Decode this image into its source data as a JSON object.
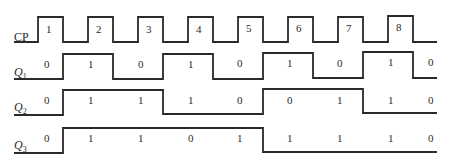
{
  "diagram": {
    "signals": [
      {
        "id": "cp",
        "label_main": "CP",
        "label_sub": "",
        "label_x": 14,
        "label_y": 41,
        "path": "M14,42 L38,42 L38,17 L63,17 L63,42 L88,42 L88,17 L113,17 L113,42 L138,42 L138,17 L163,17 L163,42 L188,42 L188,17 L213,17 L213,42 L238,42 L238,17 L263,17 L263,42 L288,42 L288,17 L313,17 L313,42 L338,42 L338,17 L363,17 L363,42 L388,42 L388,16 L413,16 L413,42 L437,42",
        "values": [
          {
            "text": "1",
            "x": 46,
            "y": 33
          },
          {
            "text": "2",
            "x": 96,
            "y": 33
          },
          {
            "text": "3",
            "x": 146,
            "y": 33
          },
          {
            "text": "4",
            "x": 196,
            "y": 33
          },
          {
            "text": "5",
            "x": 246,
            "y": 32
          },
          {
            "text": "6",
            "x": 296,
            "y": 32
          },
          {
            "text": "7",
            "x": 346,
            "y": 32
          },
          {
            "text": "8",
            "x": 396,
            "y": 31
          }
        ]
      },
      {
        "id": "q1",
        "label_main": "Q",
        "label_sub": "1",
        "label_x": 14,
        "label_y": 76,
        "path": "M14,79 L63,79 L63,54 L113,54 L113,79 L163,79 L163,54 L213,54 L213,79 L263,79 L263,53 L313,53 L313,78 L363,78 L363,52 L413,52 L413,78 L437,78",
        "values": [
          {
            "text": "0",
            "x": 44,
            "y": 68
          },
          {
            "text": "1",
            "x": 88,
            "y": 68
          },
          {
            "text": "0",
            "x": 138,
            "y": 68
          },
          {
            "text": "1",
            "x": 188,
            "y": 68
          },
          {
            "text": "0",
            "x": 237,
            "y": 67
          },
          {
            "text": "1",
            "x": 287,
            "y": 67
          },
          {
            "text": "0",
            "x": 337,
            "y": 67
          },
          {
            "text": "1",
            "x": 388,
            "y": 66
          },
          {
            "text": "0",
            "x": 428,
            "y": 66
          }
        ]
      },
      {
        "id": "q2",
        "label_main": "Q",
        "label_sub": "2",
        "label_x": 14,
        "label_y": 111,
        "path": "M14,115 L63,115 L63,90 L163,90 L163,114 L263,114 L263,89 L363,89 L363,113 L437,113",
        "values": [
          {
            "text": "0",
            "x": 44,
            "y": 104
          },
          {
            "text": "1",
            "x": 88,
            "y": 104
          },
          {
            "text": "1",
            "x": 138,
            "y": 104
          },
          {
            "text": "1",
            "x": 188,
            "y": 104
          },
          {
            "text": "0",
            "x": 237,
            "y": 104
          },
          {
            "text": "0",
            "x": 287,
            "y": 104
          },
          {
            "text": "1",
            "x": 337,
            "y": 104
          },
          {
            "text": "1",
            "x": 388,
            "y": 104
          },
          {
            "text": "0",
            "x": 428,
            "y": 104
          }
        ]
      },
      {
        "id": "q3",
        "label_main": "Q",
        "label_sub": "3",
        "label_x": 14,
        "label_y": 149,
        "path": "M14,153 L63,153 L63,128 L263,128 L263,152 L437,152",
        "values": [
          {
            "text": "0",
            "x": 44,
            "y": 142
          },
          {
            "text": "1",
            "x": 88,
            "y": 142
          },
          {
            "text": "1",
            "x": 138,
            "y": 142
          },
          {
            "text": "0",
            "x": 188,
            "y": 142
          },
          {
            "text": "1",
            "x": 237,
            "y": 142
          },
          {
            "text": "1",
            "x": 287,
            "y": 142
          },
          {
            "text": "1",
            "x": 337,
            "y": 142
          },
          {
            "text": "1",
            "x": 388,
            "y": 142
          },
          {
            "text": "0",
            "x": 428,
            "y": 142
          }
        ]
      }
    ]
  }
}
